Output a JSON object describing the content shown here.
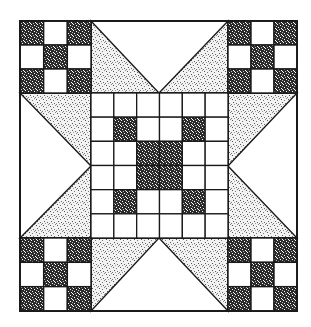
{
  "figure": {
    "colors": {
      "background": "#ffffff",
      "line": "#1a1a1a",
      "dark_fabric": "#2a2a2a",
      "light_speckle_fabric": "#d9d9d9",
      "plain_fabric": "#ffffff"
    },
    "outer_bounds": {
      "x": 20,
      "y": 21,
      "width": 277,
      "height": 290
    },
    "corner_block_size": {
      "width": 71,
      "height": 72
    },
    "center_grid": {
      "rows": 6,
      "cols": 6,
      "dark_cells": [
        [
          1,
          1
        ],
        [
          1,
          4
        ],
        [
          2,
          2
        ],
        [
          2,
          3
        ],
        [
          3,
          2
        ],
        [
          3,
          3
        ],
        [
          4,
          1
        ],
        [
          4,
          4
        ]
      ]
    },
    "nine_patch_dark_cells": [
      [
        0,
        0
      ],
      [
        0,
        2
      ],
      [
        1,
        1
      ],
      [
        2,
        0
      ],
      [
        2,
        2
      ]
    ]
  }
}
